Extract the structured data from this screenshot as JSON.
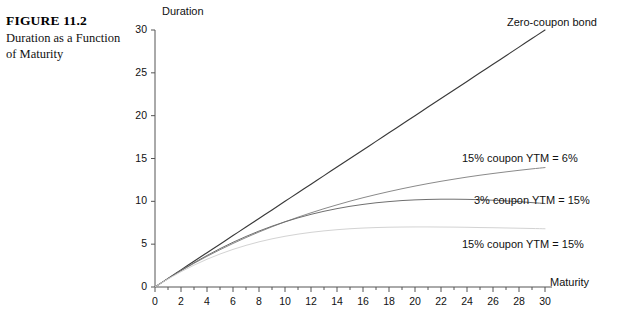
{
  "figure": {
    "number": "FIGURE 11.2",
    "title": "Duration as a Function of Maturity"
  },
  "chart_data": {
    "type": "line",
    "title": "",
    "xlabel": "Maturity",
    "ylabel": "Duration",
    "xlim": [
      0,
      30
    ],
    "ylim": [
      0,
      30
    ],
    "xticks": [
      0,
      2,
      4,
      6,
      8,
      10,
      12,
      14,
      16,
      18,
      20,
      22,
      24,
      26,
      28,
      30
    ],
    "yticks": [
      0,
      5,
      10,
      15,
      20,
      25,
      30
    ],
    "xtick_labels": [
      "0",
      "2",
      "4",
      "6",
      "8",
      "10",
      "12",
      "14",
      "16",
      "18",
      "20",
      "22",
      "24",
      "26",
      "28",
      "30"
    ],
    "ytick_labels": [
      "0",
      "5",
      "10",
      "15",
      "20",
      "25",
      "30"
    ],
    "minor_xticks": [
      1,
      3,
      5,
      7,
      9,
      11,
      13,
      15,
      17,
      19,
      21,
      23,
      25,
      27,
      29
    ],
    "grid": false,
    "legend": "inline-annotations",
    "x": [
      0,
      1,
      2,
      3,
      4,
      5,
      6,
      7,
      8,
      9,
      10,
      11,
      12,
      13,
      14,
      15,
      16,
      17,
      18,
      19,
      20,
      21,
      22,
      23,
      24,
      25,
      26,
      27,
      28,
      29,
      30
    ],
    "series": [
      {
        "name": "Zero-coupon bond",
        "color": "#3a3a3a",
        "width": 1.15,
        "label_x": 30,
        "label_y": 30,
        "values": [
          0,
          1,
          2,
          3,
          4,
          5,
          6,
          7,
          8,
          9,
          10,
          11,
          12,
          13,
          14,
          15,
          16,
          17,
          18,
          19,
          20,
          21,
          22,
          23,
          24,
          25,
          26,
          27,
          28,
          29,
          30
        ]
      },
      {
        "name": "15% coupon YTM = 6%",
        "color": "#8a8a8a",
        "width": 1.0,
        "label_x": 30,
        "label_y": 13.1,
        "values": [
          0,
          0.97,
          1.89,
          2.76,
          3.58,
          4.35,
          5.08,
          5.77,
          6.42,
          7.03,
          7.61,
          8.15,
          8.66,
          9.14,
          9.59,
          10.02,
          10.42,
          10.79,
          11.14,
          11.47,
          11.78,
          12.07,
          12.34,
          12.59,
          12.83,
          13.05,
          13.25,
          13.44,
          13.62,
          13.79,
          13.94
        ]
      },
      {
        "name": "3% coupon YTM = 15%",
        "color": "#6f6f6f",
        "width": 1.0,
        "label_x": 30,
        "label_y": 9.2,
        "values": [
          0,
          0.98,
          1.93,
          2.83,
          3.68,
          4.48,
          5.22,
          5.9,
          6.53,
          7.1,
          7.61,
          8.07,
          8.48,
          8.84,
          9.15,
          9.42,
          9.64,
          9.83,
          9.97,
          10.09,
          10.17,
          10.22,
          10.25,
          10.25,
          10.23,
          10.19,
          10.13,
          10.05,
          9.96,
          9.85,
          9.74
        ]
      },
      {
        "name": "15% coupon YTM = 15%",
        "color": "#d3d3d3",
        "width": 1.0,
        "label_x": 30,
        "label_y": 6.5,
        "values": [
          0,
          0.93,
          1.78,
          2.55,
          3.24,
          3.85,
          4.39,
          4.86,
          5.27,
          5.62,
          5.92,
          6.17,
          6.38,
          6.55,
          6.69,
          6.8,
          6.88,
          6.94,
          6.98,
          7.0,
          7.01,
          7.01,
          7.0,
          6.99,
          6.97,
          6.94,
          6.92,
          6.89,
          6.86,
          6.83,
          6.8
        ]
      }
    ],
    "annotations": [
      {
        "text": "Zero-coupon bond",
        "at_x": 507,
        "at_y": 16
      },
      {
        "text": "15% coupon YTM = 6%",
        "at_x": 462,
        "at_y": 152
      },
      {
        "text": "3% coupon YTM = 15%",
        "at_x": 474,
        "at_y": 194
      },
      {
        "text": "15% coupon YTM = 15%",
        "at_x": 462,
        "at_y": 238
      }
    ]
  }
}
